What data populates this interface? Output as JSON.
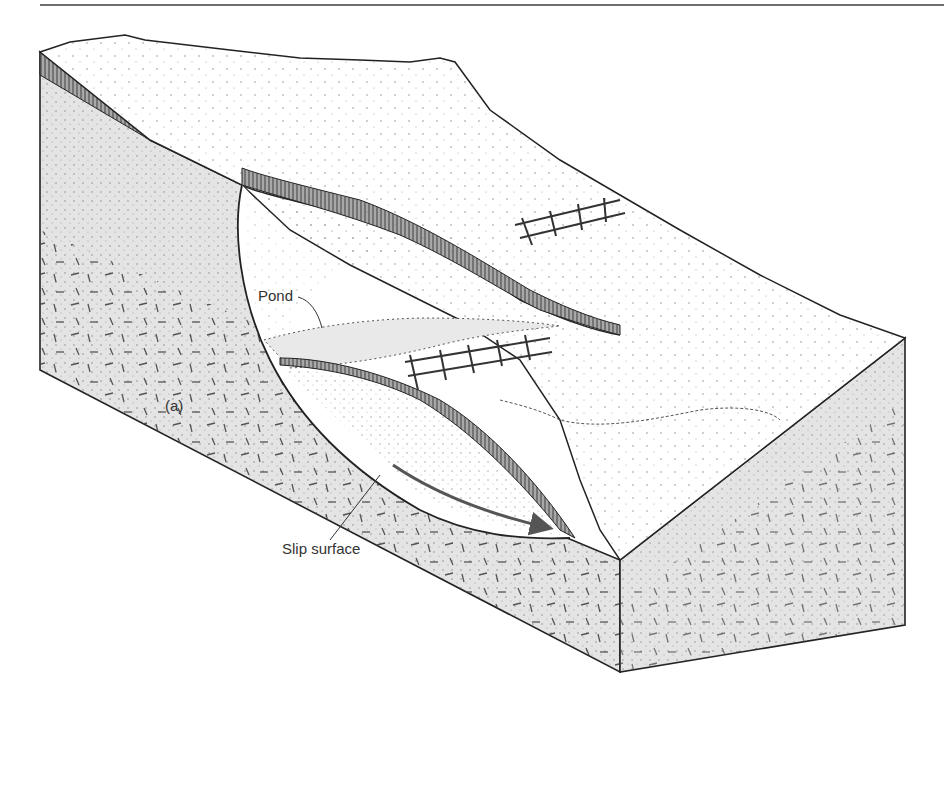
{
  "figure": {
    "panel_label": "(a)",
    "labels": {
      "pond": "Pond",
      "slip_surface": "Slip surface"
    },
    "colors": {
      "face_fill": "#e4e4e4",
      "outline": "#222222",
      "soil_layer": "#9a9a9a",
      "arrow": "#555555",
      "rule": "#6e6e6e"
    }
  }
}
